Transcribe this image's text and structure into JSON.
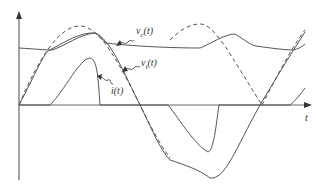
{
  "diagram": {
    "type": "waveform",
    "axes": {
      "x_label": "t",
      "y_label": ""
    },
    "labels": {
      "vc": {
        "main": "v",
        "sub": "c",
        "arg": "(t)"
      },
      "vi": {
        "main": "v",
        "sub": "i",
        "arg": "(t)"
      },
      "i": {
        "main": "i",
        "sub": "",
        "arg": "(t)"
      }
    },
    "curves": [
      {
        "name": "source-sine",
        "style": "dashed",
        "description": "reference sinusoid"
      },
      {
        "name": "v_i(t)",
        "style": "solid",
        "description": "input voltage following sinusoid with clipping"
      },
      {
        "name": "v_c(t)",
        "style": "solid",
        "description": "capacitor voltage, near-constant with ripple"
      },
      {
        "name": "i(t)",
        "style": "solid",
        "description": "pulsed current"
      }
    ],
    "colors": {
      "stroke": "#555555",
      "axis": "#666666",
      "background": "#ffffff"
    }
  }
}
